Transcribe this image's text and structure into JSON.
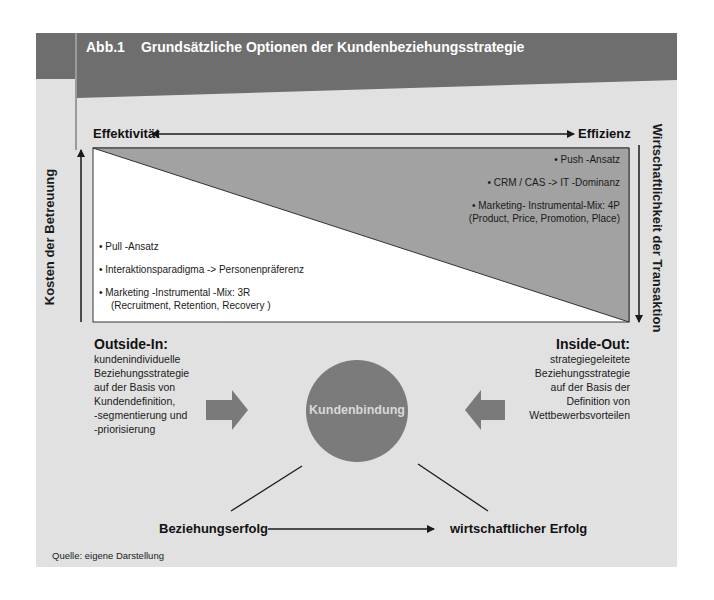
{
  "figure": {
    "number": "Abb.1",
    "title": "Grundsätzliche Optionen der Kundenbeziehungsstrategie",
    "source": "Quelle: eigene Darstellung"
  },
  "axes": {
    "top_left": "Effektivität",
    "top_right": "Effizienz",
    "left_vertical": "Kosten der Betreuung",
    "right_vertical": "Wirtschaftlichkeit der Transaktion"
  },
  "triangle": {
    "upper_right_items": [
      {
        "text": "• Push -Ansatz"
      },
      {
        "text": "• CRM / CAS -> IT -Dominanz"
      },
      {
        "text": "• Marketing- Instrumental-Mix: 4P",
        "sub": "(Product, Price, Promotion, Place)"
      }
    ],
    "lower_left_items": [
      {
        "text": "•   Pull -Ansatz"
      },
      {
        "text": "•   Interaktionsparadigma -> Personenpräferenz"
      },
      {
        "text": "•   Marketing -Instrumental -Mix: 3R",
        "sub": "(Recruitment, Retention, Recovery )"
      }
    ]
  },
  "approaches": {
    "outside_in": {
      "title": "Outside-In:",
      "lines": [
        "kundenindividuelle",
        "Beziehungsstrategie",
        "auf der Basis von",
        "Kundendefinition,",
        "-segmentierung und",
        "-priorisierung"
      ]
    },
    "inside_out": {
      "title": "Inside-Out:",
      "lines": [
        "strategiegeleitete",
        "Beziehungsstrategie",
        "auf der Basis der",
        "Definition von",
        "Wettbewerbsvorteilen"
      ]
    }
  },
  "center": {
    "label": "Kundenbindung"
  },
  "outcomes": {
    "left": "Beziehungserfolg",
    "right": "wirtschaftlicher Erfolg"
  },
  "colors": {
    "panel_bg": "#e1e1e1",
    "header_dark": "#6e6e6e",
    "triangle_fill": "#a2a2a2",
    "circle_fill": "#7b7b7b",
    "block_arrow": "#7a7a7a",
    "line": "#1a1a1a"
  }
}
